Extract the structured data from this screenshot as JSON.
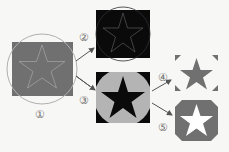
{
  "diagram": {
    "steps": [
      {
        "id": 1,
        "label": "①",
        "description": "gray square with outlined star, circle overlay"
      },
      {
        "id": 2,
        "label": "②",
        "description": "black square with outlined star and circle"
      },
      {
        "id": 3,
        "label": "③",
        "description": "gray filled circle with black star on black square"
      },
      {
        "id": 4,
        "label": "④",
        "description": "gray star on white with gray corner marks"
      },
      {
        "id": 5,
        "label": "⑤",
        "description": "white star on gray rounded square"
      }
    ],
    "colors": {
      "background": "#f7f7f5",
      "gray": "#707070",
      "light_gray": "#b4b4b4",
      "black": "#0a0a0a",
      "outline": "#9a9a9a",
      "white": "#ffffff"
    }
  }
}
